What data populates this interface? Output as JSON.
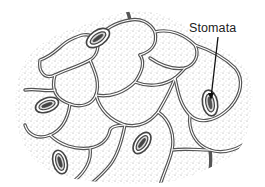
{
  "figure": {
    "label": "Stomata",
    "colors": {
      "background": "#ffffff",
      "cell_wall": "#555555",
      "stipple": "#8a8a8a",
      "label_text": "#222222",
      "pointer": "#111111"
    },
    "stomata_count": 6
  }
}
